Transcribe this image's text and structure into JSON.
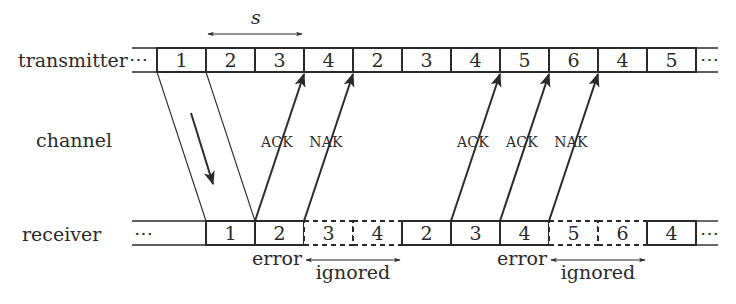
{
  "rows": {
    "transmitter": {
      "label": "transmitter",
      "lead_ellipsis": "⋯",
      "trail_ellipsis": "⋯",
      "frames": [
        {
          "n": "1",
          "x": 157,
          "dashed": false
        },
        {
          "n": "2",
          "x": 206,
          "dashed": false
        },
        {
          "n": "3",
          "x": 255,
          "dashed": false
        },
        {
          "n": "4",
          "x": 304,
          "dashed": false
        },
        {
          "n": "2",
          "x": 353,
          "dashed": false
        },
        {
          "n": "3",
          "x": 402,
          "dashed": false
        },
        {
          "n": "4",
          "x": 451,
          "dashed": false
        },
        {
          "n": "5",
          "x": 500,
          "dashed": false
        },
        {
          "n": "6",
          "x": 549,
          "dashed": false
        },
        {
          "n": "4",
          "x": 598,
          "dashed": false
        },
        {
          "n": "5",
          "x": 647,
          "dashed": false
        }
      ]
    },
    "channel": {
      "label": "channel"
    },
    "receiver": {
      "label": "receiver",
      "lead_ellipsis": "⋯",
      "trail_ellipsis": "⋯",
      "frames": [
        {
          "n": "1",
          "x": 206,
          "dashed": false
        },
        {
          "n": "2",
          "x": 255,
          "dashed": false
        },
        {
          "n": "3",
          "x": 304,
          "dashed": true
        },
        {
          "n": "4",
          "x": 353,
          "dashed": true
        },
        {
          "n": "2",
          "x": 402,
          "dashed": false
        },
        {
          "n": "3",
          "x": 451,
          "dashed": false
        },
        {
          "n": "4",
          "x": 500,
          "dashed": false
        },
        {
          "n": "5",
          "x": 549,
          "dashed": true
        },
        {
          "n": "6",
          "x": 598,
          "dashed": true
        },
        {
          "n": "4",
          "x": 647,
          "dashed": false
        }
      ]
    }
  },
  "window": {
    "label": "s"
  },
  "feedback": [
    {
      "label": "ACK",
      "from_x": 255,
      "to_x": 304
    },
    {
      "label": "NAK",
      "from_x": 304,
      "to_x": 353
    },
    {
      "label": "ACK",
      "from_x": 451,
      "to_x": 500
    },
    {
      "label": "ACK",
      "from_x": 500,
      "to_x": 549
    },
    {
      "label": "NAK",
      "from_x": 549,
      "to_x": 598
    }
  ],
  "annotations": [
    {
      "error_label": "error",
      "ignored_label": "ignored",
      "x1": 304,
      "x2": 402
    },
    {
      "error_label": "error",
      "ignored_label": "ignored",
      "x1": 549,
      "x2": 647
    }
  ],
  "colors": {
    "ink": "#2a2a2a",
    "background": "#ffffff"
  }
}
